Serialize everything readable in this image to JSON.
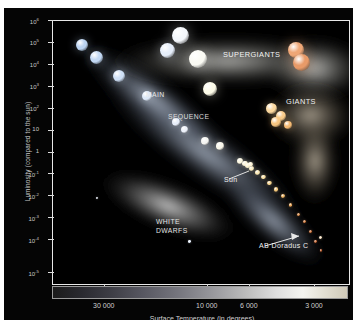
{
  "figure": {
    "kind": "hertzsprung-russell-diagram",
    "background": "#050505",
    "frame_color": "#e8e8e8"
  },
  "axes": {
    "y_title": "Luminosity (compared to the sun)",
    "x_title": "Surface Temperature (in degrees)",
    "y_ticks": [
      {
        "label": "10",
        "exp": "6",
        "pos": 0.0
      },
      {
        "label": "10",
        "exp": "5",
        "pos": 0.0833
      },
      {
        "label": "10",
        "exp": "4",
        "pos": 0.1667
      },
      {
        "label": "10",
        "exp": "3",
        "pos": 0.25
      },
      {
        "label": "10",
        "exp": "2",
        "pos": 0.3333
      },
      {
        "label": "10",
        "exp": "",
        "pos": 0.4167
      },
      {
        "label": "1",
        "exp": "",
        "pos": 0.5
      },
      {
        "label": "10",
        "exp": "-1",
        "pos": 0.5833
      },
      {
        "label": "10",
        "exp": "-2",
        "pos": 0.6667
      },
      {
        "label": "10",
        "exp": "-3",
        "pos": 0.75
      },
      {
        "label": "10",
        "exp": "-4",
        "pos": 0.8333
      },
      {
        "label": "10",
        "exp": "-5",
        "pos": 0.9583
      }
    ],
    "x_ticks": [
      {
        "label": "30 000",
        "pos": 0.175
      },
      {
        "label": "10 000",
        "pos": 0.523
      },
      {
        "label": "6 000",
        "pos": 0.665
      },
      {
        "label": "3 000",
        "pos": 0.885
      }
    ]
  },
  "annotations": [
    {
      "id": "supergiants",
      "text": "SUPERGIANTS",
      "x": 218,
      "y": 41,
      "size": 7.4,
      "color": "#f2f2f2",
      "weight": "normal"
    },
    {
      "id": "giants",
      "text": "GIANTS",
      "x": 281,
      "y": 88,
      "size": 7.4,
      "color": "#efefef",
      "weight": "normal"
    },
    {
      "id": "main",
      "text": "MAIN",
      "x": 141,
      "y": 82,
      "size": 6.8,
      "color": "#e8e8e8",
      "weight": "normal"
    },
    {
      "id": "sequence",
      "text": "SEQUENCE",
      "x": 163,
      "y": 104,
      "size": 6.8,
      "color": "#dcdcdc",
      "weight": "normal"
    },
    {
      "id": "white",
      "text": "WHITE",
      "x": 151,
      "y": 209,
      "size": 6.8,
      "color": "#e2e2e2",
      "weight": "normal"
    },
    {
      "id": "dwarfs",
      "text": "DWARFS",
      "x": 151,
      "y": 218,
      "size": 6.8,
      "color": "#e2e2e2",
      "weight": "normal"
    },
    {
      "id": "sun",
      "text": "Sun",
      "x": 219,
      "y": 167,
      "size": 7.0,
      "color": "#f0f0f0",
      "weight": "normal"
    },
    {
      "id": "ab-doradus-c",
      "text": "AB Doradus C",
      "x": 254,
      "y": 233,
      "size": 7.0,
      "color": "#f0f0f0",
      "weight": "normal"
    }
  ],
  "chart_data": {
    "type": "scatter",
    "xlabel": "Surface Temperature (in degrees)",
    "ylabel": "Luminosity (compared to the sun)",
    "xlim": [
      40000,
      2200
    ],
    "ylim": [
      1e-05,
      1000000.0
    ],
    "x_scale": "log-reversed",
    "y_scale": "log",
    "grid": false,
    "legend": "none",
    "groups": [
      {
        "name": "MAIN SEQUENCE",
        "note": "diagonal band from hot/luminous upper-left to cool/dim lower-right",
        "stars": [
          {
            "x": 30000,
            "y": 100000,
            "r": 6.0,
            "color": "#bcd4f2"
          },
          {
            "x": 26000,
            "y": 30000,
            "r": 6.5,
            "color": "#c2d8f4"
          },
          {
            "x": 21000,
            "y": 5000,
            "r": 6.0,
            "color": "#cfe0f6"
          },
          {
            "x": 16000,
            "y": 700,
            "r": 5.0,
            "color": "#dce8f8"
          },
          {
            "x": 12000,
            "y": 60,
            "r": 4.2,
            "color": "#e8eefa"
          },
          {
            "x": 11000,
            "y": 30,
            "r": 3.6,
            "color": "#eef2fb"
          },
          {
            "x": 9000,
            "y": 10,
            "r": 4.0,
            "color": "#f5f5f2"
          },
          {
            "x": 7800,
            "y": 6,
            "r": 3.8,
            "color": "#f8f6ea"
          },
          {
            "x": 6400,
            "y": 1.4,
            "r": 3.0,
            "color": "#fdf8e2"
          },
          {
            "x": 6100,
            "y": 1.1,
            "r": 2.8,
            "color": "#fdf6dc"
          },
          {
            "x": 5900,
            "y": 0.9,
            "r": 2.9,
            "color": "#fdf4d2"
          },
          {
            "x": 5700,
            "y": 0.7,
            "r": 2.6,
            "color": "#fcefc6"
          },
          {
            "x": 5400,
            "y": 0.45,
            "r": 2.5,
            "color": "#fbe9b6"
          },
          {
            "x": 5100,
            "y": 0.3,
            "r": 2.4,
            "color": "#f9e0a4"
          },
          {
            "x": 4800,
            "y": 0.17,
            "r": 2.3,
            "color": "#f7d591"
          },
          {
            "x": 4500,
            "y": 0.09,
            "r": 2.1,
            "color": "#f4c87c"
          },
          {
            "x": 4200,
            "y": 0.05,
            "r": 2.0,
            "color": "#f0b96a"
          },
          {
            "x": 3900,
            "y": 0.02,
            "r": 1.9,
            "color": "#eaa85c"
          },
          {
            "x": 3600,
            "y": 0.008,
            "r": 1.7,
            "color": "#e2924e"
          },
          {
            "x": 3400,
            "y": 0.004,
            "r": 1.6,
            "color": "#d98244"
          },
          {
            "x": 3200,
            "y": 0.0015,
            "r": 1.5,
            "color": "#d0743c"
          },
          {
            "x": 3050,
            "y": 0.0006,
            "r": 1.4,
            "color": "#c86a38"
          },
          {
            "x": 2900,
            "y": 0.00025,
            "r": 1.3,
            "color": "#c06234"
          }
        ]
      },
      {
        "name": "SUPERGIANTS",
        "note": "upper horizontal band of very large luminous stars",
        "stars": [
          {
            "x": 11500,
            "y": 250000,
            "r": 8.5,
            "color": "#f4f7fb"
          },
          {
            "x": 13000,
            "y": 60000,
            "r": 7.5,
            "color": "#e6eefa"
          },
          {
            "x": 9700,
            "y": 25000,
            "r": 9.0,
            "color": "#fbfbf4"
          },
          {
            "x": 8600,
            "y": 1500,
            "r": 7.0,
            "color": "#fdfbe8"
          },
          {
            "x": 3700,
            "y": 60000,
            "r": 8.0,
            "color": "#f0a878"
          },
          {
            "x": 3500,
            "y": 18000,
            "r": 8.5,
            "color": "#e89a68"
          }
        ]
      },
      {
        "name": "GIANTS",
        "note": "cool luminous clump right of the main sequence",
        "stars": [
          {
            "x": 4700,
            "y": 220,
            "r": 5.5,
            "color": "#fbd9a0"
          },
          {
            "x": 4300,
            "y": 110,
            "r": 5.0,
            "color": "#f8cc8c"
          },
          {
            "x": 4500,
            "y": 60,
            "r": 4.6,
            "color": "#f7c681"
          },
          {
            "x": 4000,
            "y": 45,
            "r": 4.2,
            "color": "#f4ba74"
          }
        ]
      },
      {
        "name": "WHITE DWARFS",
        "note": "faint hot stars in the lower-left ellipse",
        "stars": [
          {
            "x": 26000,
            "y": 0.04,
            "r": 1.1,
            "color": "#eef4ff"
          },
          {
            "x": 10500,
            "y": 0.0006,
            "r": 1.3,
            "color": "#eaf2ff"
          }
        ]
      },
      {
        "name": "labelled-objects",
        "stars": [
          {
            "x": 5778,
            "y": 1,
            "r": 2.4,
            "color": "#fff6d8",
            "label": "Sun"
          },
          {
            "x": 2900,
            "y": 0.0009,
            "r": 1.6,
            "color": "#ffe9c8",
            "label": "AB Doradus C"
          }
        ]
      }
    ]
  }
}
